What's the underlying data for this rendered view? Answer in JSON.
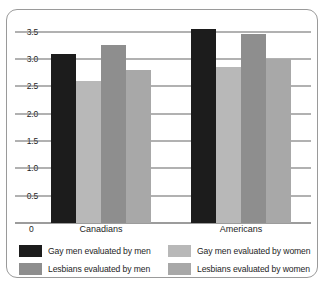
{
  "chart_data": {
    "type": "bar",
    "title": "",
    "subtitle": "",
    "xlabel": "",
    "ylabel": "",
    "categories": [
      "Canadians",
      "Americans"
    ],
    "series": [
      {
        "name": "Gay men evaluated by men",
        "values": [
          3.1,
          3.55
        ],
        "color": "#1c1c1c"
      },
      {
        "name": "Gay men evaluated by women",
        "values": [
          2.6,
          2.85
        ],
        "color": "#b8b8b8"
      },
      {
        "name": "Lesbians evaluated by men",
        "values": [
          3.25,
          3.45
        ],
        "color": "#8e8e8e"
      },
      {
        "name": "Lesbians evaluated by women",
        "values": [
          2.8,
          3.0
        ],
        "color": "#a8a8a8"
      }
    ],
    "ylim": [
      0,
      3.75
    ],
    "yticks": [
      0,
      0.5,
      1.0,
      1.5,
      2.0,
      2.5,
      3.0,
      3.5
    ],
    "ytick_labels": [
      "0",
      "0.5",
      "1.0",
      "1.5",
      "2.0",
      "2.5",
      "3.0",
      "3.5"
    ],
    "grid": true,
    "legend_position": "bottom",
    "legend_columns": 2,
    "legend_order": [
      0,
      1,
      2,
      3
    ]
  },
  "axis": {
    "zero_label": "0"
  },
  "style": {
    "border_color": "#9a9a9a",
    "gridline_color": "#646464",
    "text_color": "#1e1e1e",
    "background": "#ffffff"
  }
}
